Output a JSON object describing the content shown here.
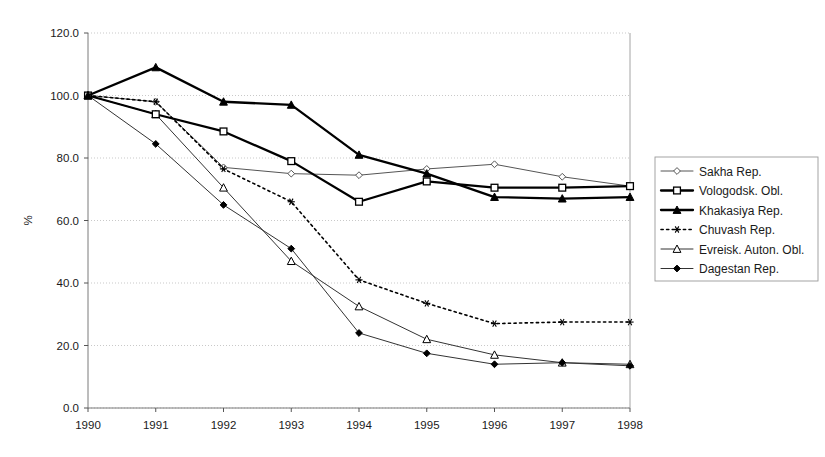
{
  "chart_data": {
    "type": "line",
    "title": "",
    "xlabel": "",
    "ylabel": "%",
    "x": [
      1990,
      1991,
      1992,
      1993,
      1994,
      1995,
      1996,
      1997,
      1998
    ],
    "xtick_labels": [
      "1990",
      "1991",
      "1992",
      "1993",
      "1994",
      "1995",
      "1996",
      "1997",
      "1998"
    ],
    "ytick_labels": [
      "0.0",
      "20.0",
      "40.0",
      "60.0",
      "80.0",
      "100.0",
      "120.0"
    ],
    "ytick_values": [
      0,
      20,
      40,
      60,
      80,
      100,
      120
    ],
    "ylim": [
      0,
      120
    ],
    "xlim": [
      1990,
      1998
    ],
    "grid": "horizontal-dotted-light",
    "legend_position": "right",
    "series": [
      {
        "name": "Sakha Rep.",
        "marker": "open-diamond",
        "line_style": "solid",
        "line_width": "thin",
        "color": "#555555",
        "values": [
          100,
          98,
          77,
          75,
          74.5,
          76.5,
          78,
          74,
          71
        ]
      },
      {
        "name": "Vologodsk. Obl.",
        "marker": "open-square",
        "line_style": "solid",
        "line_width": "thick",
        "color": "#000000",
        "values": [
          100,
          94,
          88.5,
          79,
          66,
          72.5,
          70.5,
          70.5,
          71
        ]
      },
      {
        "name": "Khakasiya Rep.",
        "marker": "filled-triangle",
        "line_style": "solid",
        "line_width": "thick",
        "color": "#000000",
        "values": [
          100,
          109,
          98,
          97,
          81,
          75,
          67.5,
          67,
          67.5
        ]
      },
      {
        "name": "Chuvash Rep.",
        "marker": "asterisk",
        "line_style": "dotted",
        "line_width": "medium",
        "color": "#000000",
        "values": [
          100,
          98,
          76.5,
          66,
          41,
          33.5,
          27,
          27.5,
          27.5
        ]
      },
      {
        "name": "Evreisk. Auton. Obl.",
        "marker": "open-triangle",
        "line_style": "solid",
        "line_width": "thin",
        "color": "#333333",
        "values": [
          100,
          94,
          70.5,
          47,
          32.5,
          22,
          17,
          14.5,
          14
        ]
      },
      {
        "name": "Dagestan Rep.",
        "marker": "filled-diamond",
        "line_style": "solid",
        "line_width": "thin",
        "color": "#333333",
        "values": [
          100,
          84.5,
          65,
          51,
          24,
          17.5,
          14,
          14.5,
          13.5
        ]
      }
    ]
  },
  "legend": {
    "items": [
      {
        "label": "Sakha Rep."
      },
      {
        "label": "Vologodsk. Obl."
      },
      {
        "label": "Khakasiya Rep."
      },
      {
        "label": "Chuvash Rep."
      },
      {
        "label": "Evreisk. Auton. Obl."
      },
      {
        "label": "Dagestan Rep."
      }
    ]
  },
  "axes": {
    "y_title": "%"
  }
}
